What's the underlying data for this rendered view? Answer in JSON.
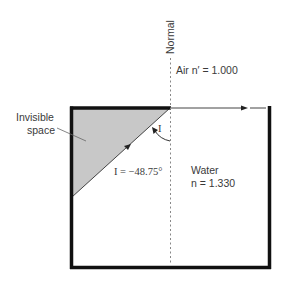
{
  "diagram": {
    "normal_label": "Normal",
    "air_label": "Air n′ = 1.000",
    "invisible_space_label_line1": "Invisible",
    "invisible_space_label_line2": "space",
    "angle_symbol": "I",
    "angle_value_label": "I = −48.75°",
    "water_label": "Water",
    "water_index_label": "n = 1.330",
    "colors": {
      "box_border": "#111111",
      "invisible_fill": "#c8c8c8",
      "ray": "#333333",
      "normal_line": "#777777",
      "text": "#3a3a3a"
    }
  }
}
